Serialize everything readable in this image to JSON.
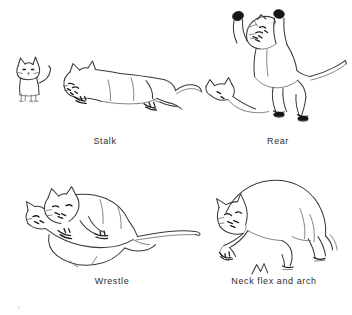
{
  "figure": {
    "background_color": "#ffffff",
    "ink_color": "#3a3a3c",
    "accent_color": "#161618",
    "width": 352,
    "height": 315,
    "style": "pen-and-ink line drawing",
    "panel_count": 4,
    "layout": "2 columns x 2 rows"
  },
  "panels": [
    {
      "id": "stalk",
      "caption": "Stalk",
      "row": 1,
      "column": 1,
      "figures": [
        {
          "name": "small standing kitten",
          "pose": "facing viewer, upright tail",
          "scale": "small"
        },
        {
          "name": "stalking cat",
          "pose": "crouched low, body elongated, head lowered forward, tail extended straight back",
          "scale": "large"
        }
      ]
    },
    {
      "id": "rear",
      "caption": "Rear",
      "row": 1,
      "column": 2,
      "figures": [
        {
          "name": "rearing cat",
          "pose": "standing on hind legs, both forepaws raised above head, ears flattened, tail extended to the side",
          "scale": "large"
        },
        {
          "name": "seated partner cat",
          "pose": "sitting low at left, only head and shoulders drawn",
          "scale": "small"
        }
      ]
    },
    {
      "id": "wrestle",
      "caption": "Wrestle",
      "row": 2,
      "column": 1,
      "figures": [
        {
          "name": "upper wrestling cat",
          "pose": "lying across partner, head down and forelegs gripping",
          "scale": "large"
        },
        {
          "name": "lower wrestling cat",
          "pose": "on its back beneath partner, heads interlocked, long tail sweeping right",
          "scale": "large"
        }
      ]
    },
    {
      "id": "neck-flex-and-arch",
      "caption": "Neck flex and arch",
      "row": 2,
      "column": 2,
      "figures": [
        {
          "name": "arching cat",
          "pose": "back strongly arched, neck flexed with head tucked down toward forepaws",
          "scale": "large"
        },
        {
          "name": "ground mark",
          "pose": "small zigzag scribble below the cat",
          "scale": "tiny"
        }
      ]
    }
  ],
  "icons": {
    "kitten": "standing-kitten-icon",
    "stalk": "stalking-cat-icon",
    "rear": "rearing-cat-icon",
    "wrestle": "wrestling-cats-icon",
    "arch": "arching-cat-icon"
  }
}
